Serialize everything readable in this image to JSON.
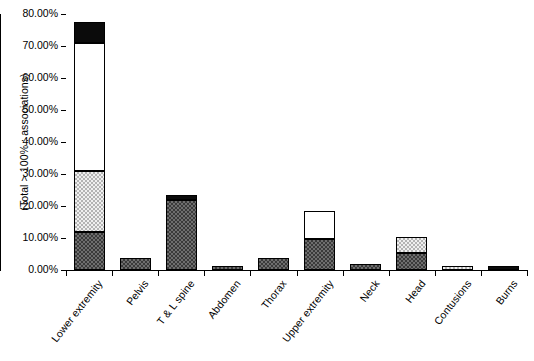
{
  "chart_data": {
    "type": "bar",
    "subtype": "stacked-bar",
    "title": "",
    "xlabel": "",
    "ylabel": "(Total > 100% : associations)",
    "ylim": [
      0,
      80
    ],
    "ytick_labels": [
      "0.00%",
      "10.00%",
      "20.00%",
      "30.00%",
      "40.00%",
      "50.00%",
      "60.00%",
      "70.00%",
      "80.00%"
    ],
    "ytick_values": [
      0,
      10,
      20,
      30,
      40,
      50,
      60,
      70,
      80
    ],
    "grid": false,
    "legend": "none",
    "categories": [
      "Lower extremity",
      "Pelvis",
      "T & L spine",
      "Abdomen",
      "Thorax",
      "Upper extremity",
      "Neck",
      "Head",
      "Contusions",
      "Burns"
    ],
    "series": [
      {
        "name": "dark-hatch",
        "fill": "dark-crosshatch",
        "values": [
          11.9,
          3.8,
          22.0,
          1.4,
          3.8,
          9.7,
          2.0,
          5.3,
          0.0,
          0.0
        ]
      },
      {
        "name": "light-hatch",
        "fill": "light-crosshatch",
        "values": [
          19.1,
          0.0,
          0.0,
          0.0,
          0.0,
          0.0,
          0.0,
          5.0,
          1.3,
          0.0
        ]
      },
      {
        "name": "white",
        "fill": "solid-white",
        "values": [
          40.0,
          0.0,
          0.0,
          0.0,
          0.0,
          8.7,
          0.0,
          0.0,
          0.0,
          0.0
        ]
      },
      {
        "name": "black",
        "fill": "solid-black",
        "values": [
          6.5,
          0.0,
          1.3,
          0.0,
          0.0,
          0.0,
          0.0,
          0.0,
          0.0,
          1.2
        ]
      }
    ],
    "totals": [
      77.5,
      3.8,
      23.3,
      1.4,
      3.8,
      18.4,
      2.0,
      10.3,
      1.3,
      1.2
    ]
  },
  "colors": {
    "axis": "#000000",
    "dark_hatch": "#3a3a3a",
    "light_hatch": "#b4b4b4",
    "white": "#ffffff",
    "black": "#0b0b0b",
    "background": "#ffffff"
  }
}
